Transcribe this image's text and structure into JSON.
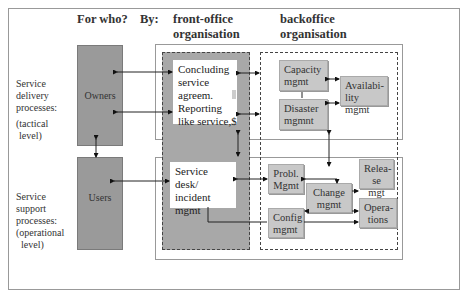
{
  "headers": {
    "for_who": "For who?",
    "by": "By:",
    "front_office": [
      "front-office",
      "organisation"
    ],
    "backoffice": [
      "backoffice",
      "organisation"
    ]
  },
  "side_labels": {
    "delivery": [
      "Service",
      "delivery",
      "processes:",
      "(tactical",
      "level)"
    ],
    "support": [
      "Service",
      "support",
      "processes:",
      "(operational",
      "level)"
    ]
  },
  "actors": {
    "owners": "Owners",
    "users": "Users"
  },
  "front_office_boxes": {
    "concluding": [
      "Concluding",
      "service",
      "agreem.",
      "Reporting",
      "like service,$"
    ],
    "service_desk": [
      "Service desk/",
      "incident",
      "mgmt"
    ]
  },
  "backoffice_boxes": {
    "capacity": [
      "Capacity",
      "mgmt"
    ],
    "disaster": [
      "Disaster",
      "mgmnt"
    ],
    "availability": [
      "Availabi-",
      "lity mgmt"
    ],
    "problem": [
      "Probl.",
      "Mgmt"
    ],
    "change": [
      "Change",
      "mgmt"
    ],
    "config": [
      "Config",
      "mgmt"
    ],
    "release": [
      "Relea-",
      "se mgt"
    ],
    "operations": [
      "Opera-",
      "tions"
    ]
  },
  "colors": {
    "actor_fill": "#9a9a9a",
    "front_office_fill": "#a8a8a8",
    "process_box_fill": "#c8c8c8",
    "border": "#999999"
  }
}
